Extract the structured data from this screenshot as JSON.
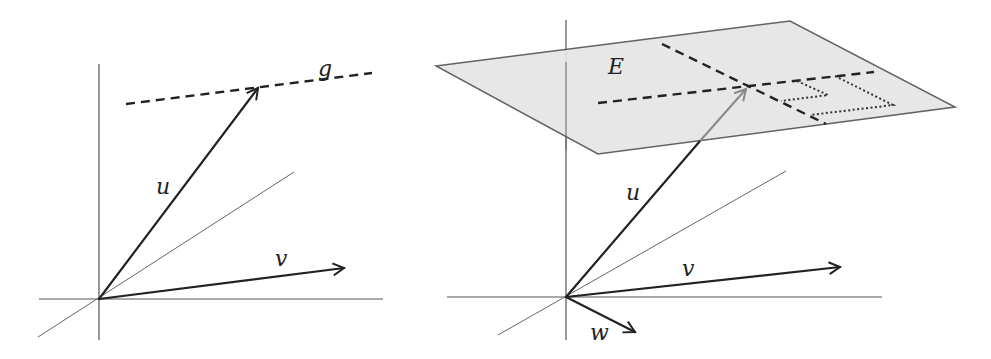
{
  "left_panel": {
    "labels": {
      "u": "u",
      "v": "v",
      "g": "g"
    },
    "origin": [
      99,
      299
    ],
    "vectors": {
      "u": {
        "from": [
          99,
          299
        ],
        "to": [
          259,
          87
        ]
      },
      "v": {
        "from": [
          99,
          299
        ],
        "to": [
          345,
          268
        ]
      }
    },
    "line_g": {
      "from": [
        126,
        104
      ],
      "to": [
        372,
        73
      ],
      "style": "dashed"
    }
  },
  "right_panel": {
    "labels": {
      "u": "u",
      "v": "v",
      "w": "w",
      "E": "E"
    },
    "origin": [
      566,
      297
    ],
    "plane_E": {
      "corners": [
        [
          436,
          66
        ],
        [
          790,
          21
        ],
        [
          955,
          107
        ],
        [
          598,
          154
        ]
      ],
      "fill": "#e6e6e6"
    },
    "vectors": {
      "u": {
        "from": [
          566,
          297
        ],
        "to": [
          747,
          88
        ]
      },
      "v": {
        "from": [
          566,
          297
        ],
        "to": [
          841,
          267
        ]
      },
      "w": {
        "from": [
          566,
          297
        ],
        "to": [
          636,
          332
        ]
      }
    }
  },
  "colors": {
    "ink": "#222222",
    "axis": "#555555",
    "plane": "#e6e6e6"
  }
}
